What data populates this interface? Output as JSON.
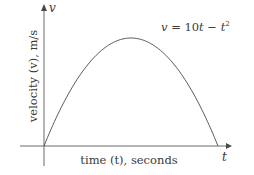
{
  "chart_data": {
    "type": "line",
    "title": "",
    "equation": "v = 10t − t²",
    "equation_parts": {
      "lhs": "v",
      "eq": " = 10",
      "t1": "t",
      "minus": " − ",
      "t2": "t",
      "exp": "2"
    },
    "xlabel": "time (t), seconds",
    "ylabel": "velocity (v), m/s",
    "x_axis_symbol": "t",
    "y_axis_symbol": "v",
    "xlim": [
      0,
      10.5
    ],
    "ylim": [
      0,
      32
    ],
    "grid": false,
    "legend": "none",
    "series": [
      {
        "name": "v = 10t − t²",
        "x": [
          0,
          1,
          2,
          3,
          4,
          5,
          6,
          7,
          8,
          9,
          10
        ],
        "y": [
          0,
          9,
          16,
          21,
          24,
          25,
          24,
          21,
          16,
          9,
          0
        ]
      }
    ]
  },
  "labels": {
    "xlabel": "time (t), seconds",
    "ylabel": "velocity (v), m/s",
    "x_symbol": "t",
    "y_symbol": "v"
  }
}
